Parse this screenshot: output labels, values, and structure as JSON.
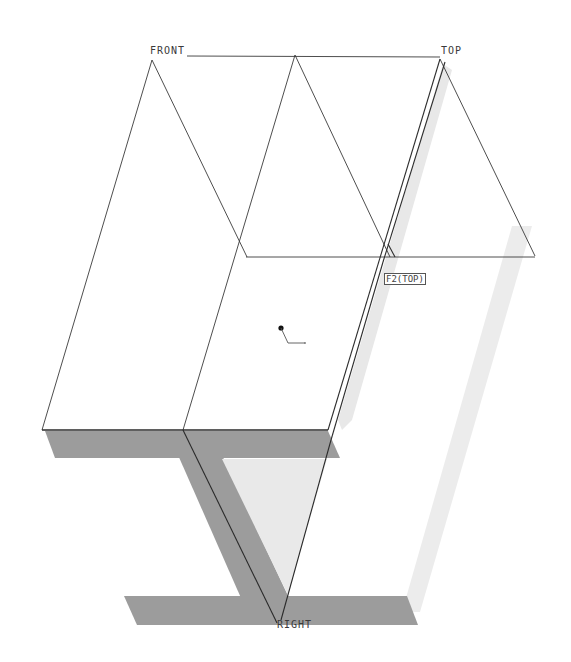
{
  "viewport": {
    "background": "#ffffff",
    "line_color": "#333333",
    "shadow_dark": "#9a9a9a",
    "shadow_light": "#e6e6e6"
  },
  "datum_planes": {
    "front": {
      "label": "FRONT"
    },
    "top": {
      "label": "TOP"
    },
    "right": {
      "label": "RIGHT"
    }
  },
  "features": {
    "sketch_tag": {
      "label": "F2(TOP)"
    }
  }
}
